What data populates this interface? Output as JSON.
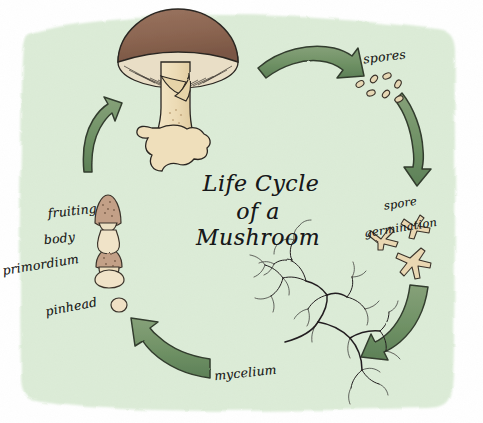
{
  "illustration": {
    "kind": "hand-drawn watercolor diagram",
    "title_line_1": "Life Cycle",
    "title_line_2": "of a Mushroom",
    "background_color": "#dcecd7",
    "paper_color": "#ffffff",
    "ink_color": "#1d1d1b",
    "arrow_fill": "#74936a",
    "arrow_outline": "#2f3a2b",
    "cap_color": "#8b6450",
    "gill_color": "#e9dec6",
    "stem_color": "#efdfbb",
    "spore_color": "#e6d7b4",
    "mycelium_color": "#231f20"
  },
  "stages": [
    {
      "id": "fruiting-body",
      "label_line_1": "fruiting",
      "label_line_2": "body",
      "order": 1
    },
    {
      "id": "spores",
      "label": "spores",
      "order": 2,
      "count_drawn": 7
    },
    {
      "id": "spore-germination",
      "label_line_1": "spore",
      "label_line_2": "germination",
      "order": 3,
      "count_drawn": 3
    },
    {
      "id": "mycelium",
      "label": "mycelium",
      "order": 4
    },
    {
      "id": "pinhead",
      "label": "pinhead",
      "order": 5
    },
    {
      "id": "primordium",
      "label": "primordium",
      "order": 6
    }
  ],
  "arrows": [
    {
      "id": "arrow-top-right",
      "from": "fruiting-body",
      "to": "spores",
      "direction": "right"
    },
    {
      "id": "arrow-right-upper",
      "from": "spores",
      "to": "spore-germination",
      "direction": "down"
    },
    {
      "id": "arrow-right-lower",
      "from": "spore-germination",
      "to": "mycelium",
      "direction": "down-left"
    },
    {
      "id": "arrow-bottom-left",
      "from": "mycelium",
      "to": "pinhead",
      "direction": "left-up"
    },
    {
      "id": "arrow-left",
      "from": "primordium",
      "to": "fruiting-body",
      "direction": "up-right"
    }
  ]
}
